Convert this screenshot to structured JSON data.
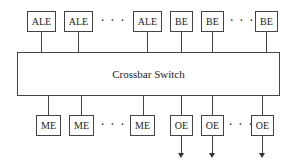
{
  "diagram": {
    "top_row": [
      {
        "label": "ALE",
        "x": 27,
        "w": 28
      },
      {
        "label": "ALE",
        "x": 64,
        "w": 28
      },
      {
        "label": "ALE",
        "x": 133,
        "w": 28
      },
      {
        "label": "BE",
        "x": 170,
        "w": 23
      },
      {
        "label": "BE",
        "x": 201,
        "w": 23
      },
      {
        "label": "BE",
        "x": 255,
        "w": 23
      }
    ],
    "top_dots": [
      {
        "text": "· · ·",
        "x": 101
      },
      {
        "text": "· · ·",
        "x": 230
      }
    ],
    "crossbar": {
      "label": "Crossbar Switch"
    },
    "bottom_row": [
      {
        "label": "ME",
        "x": 36,
        "w": 25,
        "arrow": false
      },
      {
        "label": "ME",
        "x": 69,
        "w": 25,
        "arrow": false
      },
      {
        "label": "ME",
        "x": 130,
        "w": 25,
        "arrow": false
      },
      {
        "label": "OE",
        "x": 170,
        "w": 23,
        "arrow": true
      },
      {
        "label": "OE",
        "x": 201,
        "w": 23,
        "arrow": true
      },
      {
        "label": "OE",
        "x": 251,
        "w": 23,
        "arrow": true
      }
    ],
    "bottom_dots": [
      {
        "text": "· · ·",
        "x": 101
      },
      {
        "text": "· · ·",
        "x": 229
      }
    ]
  }
}
